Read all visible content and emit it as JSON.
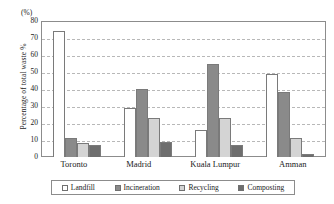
{
  "chart_data": {
    "type": "bar",
    "title": "",
    "subtitle": "",
    "xlabel": "",
    "ylabel": "Percentage of total waste %",
    "unit_label": "(%)",
    "ylim": [
      0,
      80
    ],
    "y_ticks": [
      80,
      70,
      60,
      50,
      40,
      30,
      20,
      10,
      0
    ],
    "grid": true,
    "grid_style": "dashed-horizontal",
    "legend_position": "bottom",
    "categories": [
      "Toronto",
      "Madrid",
      "Kuala Lumpur",
      "Amman"
    ],
    "series": [
      {
        "name": "Landfill",
        "color": "#ffffff",
        "values": [
          74,
          29,
          16,
          49
        ]
      },
      {
        "name": "Incineration",
        "color": "#8a8a8a",
        "values": [
          11,
          40,
          55,
          38
        ]
      },
      {
        "name": "Recycling",
        "color": "#d4d4d4",
        "values": [
          8,
          23,
          23,
          11
        ]
      },
      {
        "name": "Composting",
        "color": "#6e6e6e",
        "values": [
          7,
          9,
          7,
          2
        ]
      }
    ]
  },
  "legend": {
    "items": [
      {
        "label": "Landfill",
        "color": "#ffffff"
      },
      {
        "label": "Incineration",
        "color": "#8a8a8a"
      },
      {
        "label": "Recycling",
        "color": "#d4d4d4"
      },
      {
        "label": "Composting",
        "color": "#6e6e6e"
      }
    ]
  },
  "colors": {
    "background": "#ffffff",
    "axis": "#8c8c8c",
    "gridline": "#b8b8b8",
    "text": "#1a1a1a",
    "bar_border": "#7a7a7a"
  }
}
